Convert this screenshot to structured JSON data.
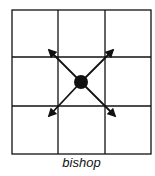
{
  "diagram": {
    "caption": "bishop",
    "grid": {
      "rows": 3,
      "cols": 3,
      "x_lines": [
        12,
        58,
        105,
        151
      ],
      "y_lines": [
        10,
        57,
        106,
        154
      ]
    },
    "piece": {
      "name": "bishop",
      "cx": 81,
      "cy": 82,
      "r": 7
    },
    "moves": [
      {
        "direction": "up-left",
        "x": 48,
        "y": 49
      },
      {
        "direction": "up-right",
        "x": 114,
        "y": 49
      },
      {
        "direction": "down-left",
        "x": 48,
        "y": 117
      },
      {
        "direction": "down-right",
        "x": 116,
        "y": 117
      }
    ],
    "colors": {
      "line": "#111111",
      "background": "#ffffff"
    }
  }
}
